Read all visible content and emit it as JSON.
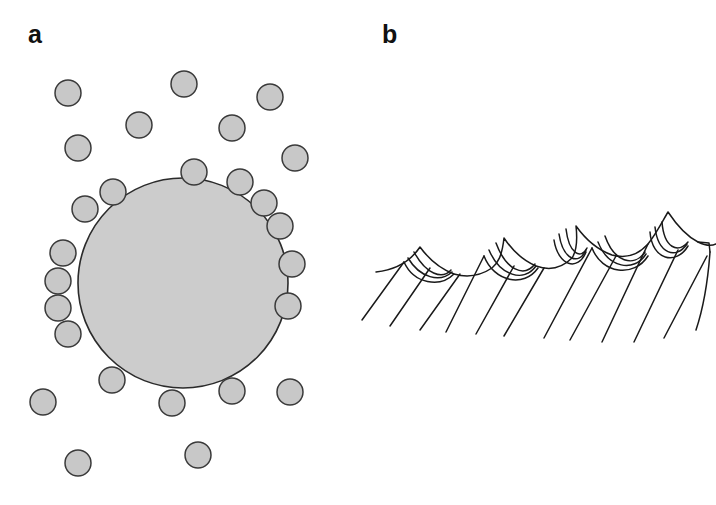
{
  "figure": {
    "background_color": "#ffffff",
    "width": 716,
    "height": 505,
    "panels": [
      {
        "id": "a",
        "label": "a",
        "subject": "colloidal particles adsorbing onto a large spherical droplet",
        "label_position": {
          "x": 28,
          "y": 22
        }
      },
      {
        "id": "b",
        "label": "b",
        "subject": "sawtooth crystalline surface profile with scalloped notches",
        "label_position": {
          "x": 382,
          "y": 22
        }
      }
    ]
  },
  "colors": {
    "particle_fill": "#c8c8c8",
    "particle_stroke": "#3a3a3a",
    "sphere_fill": "#cccccc",
    "sphere_stroke": "#2b2b2b",
    "line_stroke": "#1a1a1a",
    "label_color": "#111111",
    "background": "#ffffff"
  },
  "panel_a": {
    "large_sphere": {
      "cx": 183,
      "cy": 283,
      "r": 105
    },
    "particle_radius": 13,
    "particles_free": [
      {
        "cx": 68,
        "cy": 93
      },
      {
        "cx": 184,
        "cy": 84
      },
      {
        "cx": 270,
        "cy": 97
      },
      {
        "cx": 139,
        "cy": 125
      },
      {
        "cx": 232,
        "cy": 128
      },
      {
        "cx": 78,
        "cy": 148
      },
      {
        "cx": 295,
        "cy": 158
      },
      {
        "cx": 43,
        "cy": 402
      },
      {
        "cx": 290,
        "cy": 392
      },
      {
        "cx": 78,
        "cy": 463
      },
      {
        "cx": 198,
        "cy": 455
      }
    ],
    "particles_adsorbed": [
      {
        "cx": 194,
        "cy": 172
      },
      {
        "cx": 113,
        "cy": 192
      },
      {
        "cx": 85,
        "cy": 209
      },
      {
        "cx": 240,
        "cy": 182
      },
      {
        "cx": 264,
        "cy": 203
      },
      {
        "cx": 280,
        "cy": 226
      },
      {
        "cx": 292,
        "cy": 264
      },
      {
        "cx": 288,
        "cy": 306
      },
      {
        "cx": 63,
        "cy": 253
      },
      {
        "cx": 58,
        "cy": 281
      },
      {
        "cx": 58,
        "cy": 308
      },
      {
        "cx": 68,
        "cy": 334
      },
      {
        "cx": 112,
        "cy": 380
      },
      {
        "cx": 172,
        "cy": 403
      },
      {
        "cx": 232,
        "cy": 391
      }
    ]
  },
  "panel_b": {
    "profile_description": "jagged sawtooth ridge line with curved scallop notches on each peak's right flank and long diagonal hatch lines descending below",
    "peaks": [
      {
        "x": 62,
        "y": 47
      },
      {
        "x": 146,
        "y": 38
      },
      {
        "x": 218,
        "y": 26
      },
      {
        "x": 310,
        "y": 12
      },
      {
        "x": 404,
        "y": 22
      }
    ]
  }
}
